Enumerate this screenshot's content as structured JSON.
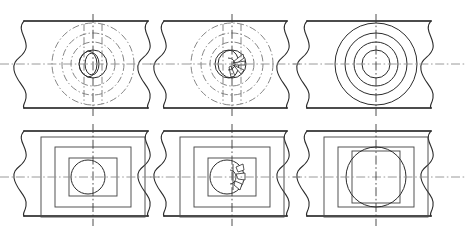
{
  "sheet": {
    "title": "Orthographic plate views with broken edges",
    "background_color": "#ffffff",
    "width": 466,
    "height": 242,
    "caption": ""
  },
  "line_styles": {
    "outline_color": "#111111",
    "break_color": "#2b2b2b",
    "visible_color": "#2b2b2b",
    "hidden_color": "#4a4a4a",
    "phantom_color": "#777777",
    "center_color": "#8e8e8e"
  },
  "layout": {
    "rows": 2,
    "columns": 3,
    "row_labels": [
      "front-circular-views",
      "side-rectangular-views"
    ],
    "column_labels": [
      "view-left",
      "view-middle",
      "view-right"
    ]
  },
  "views": [
    {
      "id": "top-left-view",
      "name": "circular-view-plain-boss",
      "row": "top",
      "column": "left",
      "center_x": 93,
      "center_y": 64,
      "plate_top_y": 21,
      "plate_bottom_y": 108,
      "plate_left_x": 20,
      "plate_right_x": 151,
      "style": "phantom",
      "circle_radii": [
        41,
        31,
        22,
        14,
        9
      ],
      "has_vanes": false,
      "has_inner_lens": true
    },
    {
      "id": "top-middle-view",
      "name": "circular-view-vaned-hub",
      "row": "top",
      "column": "middle",
      "center_x": 232,
      "center_y": 64,
      "plate_top_y": 21,
      "plate_bottom_y": 108,
      "plate_left_x": 160,
      "plate_right_x": 290,
      "style": "phantom",
      "circle_radii": [
        41,
        31,
        22,
        14,
        9
      ],
      "has_vanes": true,
      "vane_count": 5,
      "has_inner_lens": true
    },
    {
      "id": "top-right-view",
      "name": "circular-view-solid-concentric",
      "row": "top",
      "column": "right",
      "center_x": 376,
      "center_y": 64,
      "plate_top_y": 21,
      "plate_bottom_y": 108,
      "plate_left_x": 303,
      "plate_right_x": 434,
      "style": "visible",
      "circle_radii": [
        41,
        31,
        22,
        14
      ],
      "has_vanes": false,
      "has_inner_lens": false
    },
    {
      "id": "bottom-left-view",
      "name": "rectangular-view-plain-bore",
      "row": "bottom",
      "column": "left",
      "center_x": 93,
      "center_y": 177,
      "plate_top_y": 131,
      "plate_bottom_y": 216,
      "plate_left_x": 20,
      "plate_right_x": 151,
      "rect_half_widths": [
        52,
        38,
        24
      ],
      "rect_half_heights": [
        40,
        30,
        19
      ],
      "circle_radius": 17,
      "circle_offset_x": -5,
      "has_vanes": false
    },
    {
      "id": "bottom-middle-view",
      "name": "rectangular-view-vaned-bore",
      "row": "bottom",
      "column": "middle",
      "center_x": 232,
      "center_y": 177,
      "plate_top_y": 131,
      "plate_bottom_y": 216,
      "plate_left_x": 160,
      "plate_right_x": 290,
      "rect_half_widths": [
        52,
        38,
        24
      ],
      "rect_half_heights": [
        40,
        30,
        19
      ],
      "circle_radius": 17,
      "circle_offset_x": -5,
      "has_vanes": true,
      "vane_count": 4
    },
    {
      "id": "bottom-right-view",
      "name": "rectangular-view-large-bore",
      "row": "bottom",
      "column": "right",
      "center_x": 376,
      "center_y": 177,
      "plate_top_y": 131,
      "plate_bottom_y": 216,
      "plate_left_x": 303,
      "plate_right_x": 434,
      "rect_half_widths": [
        52,
        38,
        24
      ],
      "rect_half_heights": [
        40,
        30,
        26
      ],
      "circle_radius": 30,
      "circle_offset_x": 0,
      "has_vanes": false
    }
  ],
  "centerlines": {
    "top_row_y": 64,
    "bottom_row_y": 177,
    "vertical_x": [
      93,
      232,
      376
    ]
  }
}
